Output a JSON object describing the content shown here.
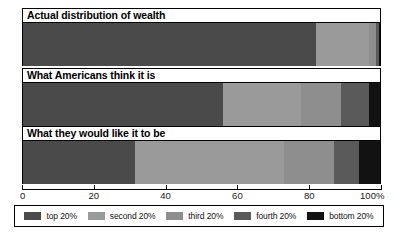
{
  "chart_data": {
    "type": "bar",
    "orientation": "horizontal",
    "stacked": true,
    "title": "",
    "xlabel": "",
    "ylabel": "",
    "xlim": [
      0,
      100
    ],
    "xticks": [
      0,
      20,
      40,
      60,
      80,
      100
    ],
    "xtick_labels": [
      "0",
      "20",
      "40",
      "60",
      "80",
      "100%"
    ],
    "grid": false,
    "legend_position": "bottom",
    "categories": [
      "Actual distribution of wealth",
      "What Americans think it is",
      "What they would like it to be"
    ],
    "series": [
      {
        "name": "top 20%",
        "color": "#4a4a4a",
        "values": [
          82.0,
          56.0,
          31.5
        ]
      },
      {
        "name": "second 20%",
        "color": "#9a9a9a",
        "values": [
          15.0,
          22.0,
          41.5
        ]
      },
      {
        "name": "third 20%",
        "color": "#8e8e8e",
        "values": [
          2.0,
          11.0,
          14.0
        ]
      },
      {
        "name": "fourth 20%",
        "color": "#5a5a5a",
        "values": [
          0.7,
          8.0,
          7.0
        ]
      },
      {
        "name": "bottom 20%",
        "color": "#121212",
        "values": [
          0.3,
          3.0,
          6.0
        ]
      }
    ],
    "bars": [
      {
        "label": "Actual distribution of wealth",
        "segments": [
          {
            "name": "top 20%",
            "value": 82.0,
            "color": "#4a4a4a"
          },
          {
            "name": "second 20%",
            "value": 15.0,
            "color": "#9a9a9a"
          },
          {
            "name": "third 20%",
            "value": 2.0,
            "color": "#8e8e8e"
          },
          {
            "name": "fourth 20%",
            "value": 0.7,
            "color": "#5a5a5a"
          },
          {
            "name": "bottom 20%",
            "value": 0.3,
            "color": "#121212"
          }
        ]
      },
      {
        "label": "What Americans think it is",
        "segments": [
          {
            "name": "top 20%",
            "value": 56.0,
            "color": "#4a4a4a"
          },
          {
            "name": "second 20%",
            "value": 22.0,
            "color": "#9a9a9a"
          },
          {
            "name": "third 20%",
            "value": 11.0,
            "color": "#8e8e8e"
          },
          {
            "name": "fourth 20%",
            "value": 8.0,
            "color": "#5a5a5a"
          },
          {
            "name": "bottom 20%",
            "value": 3.0,
            "color": "#121212"
          }
        ]
      },
      {
        "label": "What they would like it to be",
        "segments": [
          {
            "name": "top 20%",
            "value": 31.5,
            "color": "#4a4a4a"
          },
          {
            "name": "second 20%",
            "value": 41.5,
            "color": "#9a9a9a"
          },
          {
            "name": "third 20%",
            "value": 14.0,
            "color": "#8e8e8e"
          },
          {
            "name": "fourth 20%",
            "value": 7.0,
            "color": "#5a5a5a"
          },
          {
            "name": "bottom 20%",
            "value": 6.0,
            "color": "#121212"
          }
        ]
      }
    ],
    "legend": [
      {
        "label": "top 20%",
        "color": "#4a4a4a"
      },
      {
        "label": "second 20%",
        "color": "#9a9a9a"
      },
      {
        "label": "third 20%",
        "color": "#8e8e8e"
      },
      {
        "label": "fourth 20%",
        "color": "#5a5a5a"
      },
      {
        "label": "bottom 20%",
        "color": "#121212"
      }
    ]
  }
}
